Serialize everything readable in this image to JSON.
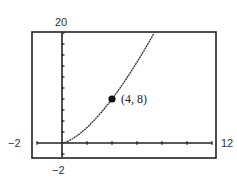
{
  "chart_data": {
    "type": "line",
    "title": "",
    "xlabel": "",
    "ylabel": "",
    "window": {
      "xmin": -2,
      "xmax": 12,
      "ymin": -2,
      "ymax": 20
    },
    "labels": {
      "xmin": "−2",
      "xmax": "12",
      "ymin": "−2",
      "ymax": "20"
    },
    "xscl": 2,
    "yscl": 2,
    "function": "y = x^(3/2), x ≥ 0",
    "x": [
      0,
      1,
      2,
      3,
      4,
      5,
      6,
      7,
      7.37
    ],
    "y": [
      0,
      1,
      2.83,
      5.2,
      8,
      11.18,
      14.7,
      18.52,
      20
    ],
    "highlighted_point": {
      "x": 4,
      "y": 8,
      "label": "(4, 8)"
    },
    "grid": false,
    "colors": {
      "curve": "#333333",
      "axes": "#222222",
      "frame": "#222222"
    }
  }
}
